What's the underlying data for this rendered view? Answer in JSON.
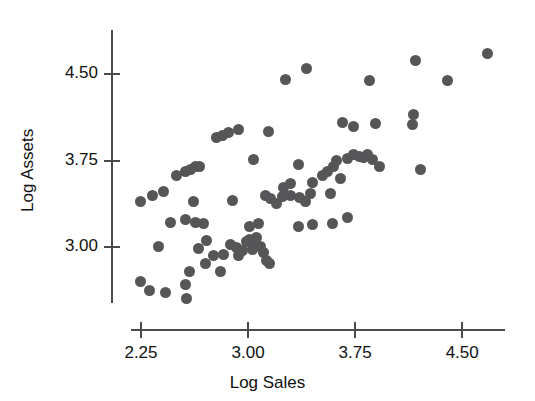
{
  "chart_data": {
    "type": "scatter",
    "title": "",
    "xlabel": "Log Sales",
    "ylabel": "Log Assets",
    "xticks": [
      "2.25",
      "3.00",
      "3.75",
      "4.50"
    ],
    "xtick_values": [
      2.25,
      3.0,
      3.75,
      4.5
    ],
    "yticks": [
      "3.00",
      "3.75",
      "4.50"
    ],
    "ytick_values": [
      3.0,
      3.75,
      4.5
    ],
    "xlim": [
      2.18,
      4.8
    ],
    "ylim": [
      2.52,
      4.88
    ],
    "grid": false,
    "legend": null,
    "marker": {
      "shape": "circle",
      "color": "#565659",
      "size_px": 11
    },
    "series": [
      {
        "name": "companies",
        "points": [
          [
            2.25,
            2.71
          ],
          [
            2.31,
            2.63
          ],
          [
            2.42,
            2.61
          ],
          [
            2.57,
            2.56
          ],
          [
            2.56,
            2.68
          ],
          [
            2.59,
            2.79
          ],
          [
            2.7,
            2.86
          ],
          [
            2.81,
            2.79
          ],
          [
            2.37,
            3.01
          ],
          [
            2.65,
            2.99
          ],
          [
            2.71,
            3.06
          ],
          [
            2.76,
            2.93
          ],
          [
            2.83,
            2.94
          ],
          [
            2.88,
            3.03
          ],
          [
            2.92,
            3.0
          ],
          [
            2.93,
            2.93
          ],
          [
            2.96,
            2.97
          ],
          [
            2.99,
            3.05
          ],
          [
            3.01,
            3.07
          ],
          [
            3.04,
            3.04
          ],
          [
            3.03,
            2.98
          ],
          [
            3.06,
            3.09
          ],
          [
            3.09,
            3.01
          ],
          [
            3.11,
            2.96
          ],
          [
            3.13,
            2.89
          ],
          [
            3.15,
            2.86
          ],
          [
            3.07,
            3.21
          ],
          [
            3.01,
            3.18
          ],
          [
            2.46,
            3.22
          ],
          [
            2.56,
            3.24
          ],
          [
            2.63,
            3.22
          ],
          [
            2.69,
            3.21
          ],
          [
            3.45,
            3.2
          ],
          [
            3.59,
            3.21
          ],
          [
            3.7,
            3.26
          ],
          [
            3.35,
            3.18
          ],
          [
            2.25,
            3.4
          ],
          [
            2.33,
            3.45
          ],
          [
            2.41,
            3.48
          ],
          [
            2.62,
            3.4
          ],
          [
            2.5,
            3.62
          ],
          [
            2.56,
            3.66
          ],
          [
            2.6,
            3.67
          ],
          [
            2.63,
            3.7
          ],
          [
            2.66,
            3.7
          ],
          [
            2.89,
            3.41
          ],
          [
            3.12,
            3.45
          ],
          [
            3.16,
            3.42
          ],
          [
            3.2,
            3.38
          ],
          [
            3.24,
            3.44
          ],
          [
            3.3,
            3.45
          ],
          [
            3.36,
            3.43
          ],
          [
            3.4,
            3.4
          ],
          [
            3.44,
            3.47
          ],
          [
            3.58,
            3.47
          ],
          [
            3.25,
            3.52
          ],
          [
            3.3,
            3.55
          ],
          [
            3.45,
            3.56
          ],
          [
            3.04,
            3.76
          ],
          [
            3.35,
            3.72
          ],
          [
            3.52,
            3.62
          ],
          [
            3.56,
            3.66
          ],
          [
            3.6,
            3.7
          ],
          [
            3.62,
            3.75
          ],
          [
            3.65,
            3.6
          ],
          [
            3.7,
            3.77
          ],
          [
            3.74,
            3.8
          ],
          [
            3.78,
            3.79
          ],
          [
            3.81,
            3.78
          ],
          [
            3.84,
            3.8
          ],
          [
            3.87,
            3.76
          ],
          [
            3.92,
            3.7
          ],
          [
            4.21,
            3.67
          ],
          [
            2.78,
            3.95
          ],
          [
            2.82,
            3.97
          ],
          [
            2.86,
            3.99
          ],
          [
            2.93,
            4.02
          ],
          [
            3.14,
            4.0
          ],
          [
            3.26,
            4.45
          ],
          [
            3.41,
            4.55
          ],
          [
            3.66,
            4.08
          ],
          [
            3.74,
            4.05
          ],
          [
            3.85,
            4.44
          ],
          [
            3.89,
            4.07
          ],
          [
            4.17,
            4.62
          ],
          [
            4.16,
            4.15
          ],
          [
            4.15,
            4.06
          ],
          [
            4.4,
            4.44
          ],
          [
            4.68,
            4.68
          ]
        ]
      }
    ]
  },
  "axes": {
    "y_axis_top_px": 30,
    "y_axis_bottom_px": 303,
    "y_axis_x_px": 111,
    "x_axis_left_px": 131,
    "x_axis_right_px": 505,
    "x_axis_y_px": 329
  }
}
